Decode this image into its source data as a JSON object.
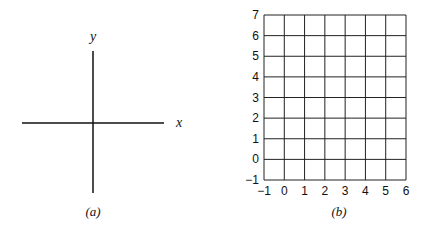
{
  "panel_a": {
    "caption": "(a)",
    "x_label": "x",
    "y_label": "y"
  },
  "panel_b": {
    "caption": "(b)",
    "x_ticks": [
      "−1",
      "0",
      "1",
      "2",
      "3",
      "4",
      "5",
      "6"
    ],
    "y_ticks": [
      "−1",
      "0",
      "1",
      "2",
      "3",
      "4",
      "5",
      "6",
      "7"
    ]
  },
  "chart_data": [
    {
      "type": "line",
      "title": "(a)",
      "xlabel": "x",
      "ylabel": "y",
      "grid": false,
      "description": "Blank coordinate axes crossing at origin"
    },
    {
      "type": "line",
      "title": "(b)",
      "xlabel": "",
      "ylabel": "",
      "xlim": [
        -1,
        6
      ],
      "ylim": [
        -1,
        7
      ],
      "x_ticks": [
        -1,
        0,
        1,
        2,
        3,
        4,
        5,
        6
      ],
      "y_ticks": [
        -1,
        0,
        1,
        2,
        3,
        4,
        5,
        6,
        7
      ],
      "grid": true,
      "description": "Empty unit grid"
    }
  ]
}
